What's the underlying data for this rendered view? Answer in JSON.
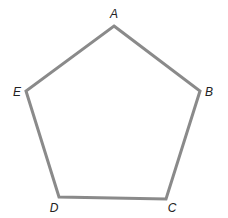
{
  "diagram": {
    "type": "pentagon",
    "stroke_color": "#8a8a8a",
    "stroke_width": 3,
    "label_color": "#222222",
    "vertices": [
      {
        "label": "A",
        "x": 114,
        "y": 26,
        "label_x": 114,
        "label_y": 18
      },
      {
        "label": "B",
        "x": 200,
        "y": 91,
        "label_x": 209,
        "label_y": 96
      },
      {
        "label": "C",
        "x": 166,
        "y": 199,
        "label_x": 172,
        "label_y": 212
      },
      {
        "label": "D",
        "x": 59,
        "y": 197,
        "label_x": 54,
        "label_y": 212
      },
      {
        "label": "E",
        "x": 26,
        "y": 91,
        "label_x": 17,
        "label_y": 96
      }
    ]
  }
}
